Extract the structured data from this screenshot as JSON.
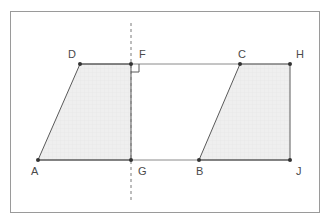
{
  "figure": {
    "frame": {
      "x": 10,
      "y": 11,
      "width": 310,
      "height": 202,
      "stroke": "#9a9a9a",
      "fill": "#ffffff"
    },
    "colors": {
      "outline": "#5a5a5a",
      "fill": "#efefef",
      "label": "#4a4a4a",
      "dashed_line": "#7a7a7a",
      "vertex": "#333333",
      "frame": "#9a9a9a",
      "grid": "#e2e2e2"
    },
    "mirror_line": {
      "name": "vertical-dashed-line-of-symmetry",
      "x": 131,
      "y_top": 23,
      "y_bottom": 200,
      "dash": "3 3",
      "stroke": "#7a7a7a"
    },
    "right_angle_marker": {
      "at_vertex": "F",
      "x": 131,
      "y": 64,
      "size": 8,
      "stroke": "#5a5a5a"
    },
    "shapes": [
      {
        "name": "left-quadrilateral-ADFG",
        "label": "ADFG",
        "points": "38,160 80,64 131,64 131,160",
        "fill": "#efefef",
        "stroke": "#5a5a5a"
      },
      {
        "name": "right-quadrilateral-BCHJ",
        "label": "BCHJ",
        "points": "199,160 240,64 290,64 290,160",
        "fill": "#efefef",
        "stroke": "#5a5a5a"
      }
    ],
    "segments": [
      {
        "name": "segment-top-DF",
        "x1": 80,
        "y1": 64,
        "x2": 131,
        "y2": 64
      },
      {
        "name": "segment-top-FC",
        "x1": 131,
        "y1": 64,
        "x2": 240,
        "y2": 64
      },
      {
        "name": "segment-top-CH",
        "x1": 240,
        "y1": 64,
        "x2": 290,
        "y2": 64
      },
      {
        "name": "segment-bottom-AG",
        "x1": 38,
        "y1": 160,
        "x2": 131,
        "y2": 160
      },
      {
        "name": "segment-bottom-GB",
        "x1": 131,
        "y1": 160,
        "x2": 199,
        "y2": 160
      },
      {
        "name": "segment-bottom-BJ",
        "x1": 199,
        "y1": 160,
        "x2": 290,
        "y2": 160
      },
      {
        "name": "segment-slant-AD",
        "x1": 38,
        "y1": 160,
        "x2": 80,
        "y2": 64
      },
      {
        "name": "segment-slant-BC",
        "x1": 199,
        "y1": 160,
        "x2": 240,
        "y2": 64
      },
      {
        "name": "segment-right-HJ",
        "x1": 290,
        "y1": 64,
        "x2": 290,
        "y2": 160
      },
      {
        "name": "segment-left-FG",
        "x1": 131,
        "y1": 64,
        "x2": 131,
        "y2": 160
      }
    ],
    "vertices": [
      {
        "id": "A",
        "label": "A",
        "x": 38,
        "y": 160,
        "label_x": 31,
        "label_y": 175
      },
      {
        "id": "D",
        "label": "D",
        "x": 80,
        "y": 64,
        "label_x": 68,
        "label_y": 58
      },
      {
        "id": "F",
        "label": "F",
        "x": 131,
        "y": 64,
        "label_x": 139,
        "label_y": 58
      },
      {
        "id": "G",
        "label": "G",
        "x": 131,
        "y": 160,
        "label_x": 138,
        "label_y": 175
      },
      {
        "id": "B",
        "label": "B",
        "x": 199,
        "y": 160,
        "label_x": 196,
        "label_y": 175
      },
      {
        "id": "C",
        "label": "C",
        "x": 240,
        "y": 64,
        "label_x": 238,
        "label_y": 58
      },
      {
        "id": "H",
        "label": "H",
        "x": 290,
        "y": 64,
        "label_x": 296,
        "label_y": 58
      },
      {
        "id": "J",
        "label": "J",
        "x": 290,
        "y": 160,
        "label_x": 296,
        "label_y": 175
      }
    ]
  }
}
